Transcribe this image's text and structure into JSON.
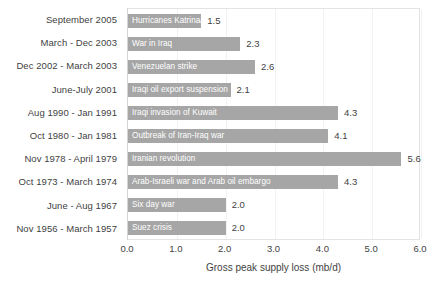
{
  "chart_data": {
    "type": "bar",
    "orientation": "horizontal",
    "title": "",
    "xlabel": "Gross peak supply loss (mb/d)",
    "ylabel": "",
    "xlim": [
      0.0,
      6.0
    ],
    "xticks": [
      "0.0",
      "1.0",
      "2.0",
      "3.0",
      "4.0",
      "5.0",
      "6.0"
    ],
    "xtick_values": [
      0.0,
      1.0,
      2.0,
      3.0,
      4.0,
      5.0,
      6.0
    ],
    "grid": true,
    "legend": "none",
    "bar_color": "#a6a6a6",
    "bar_label_color": "#ffffff",
    "value_label_color": "#3f3f3f",
    "categories": [
      "September 2005",
      "March - Dec 2003",
      "Dec 2002 - March 2003",
      "June-July 2001",
      "Aug 1990 - Jan 1991",
      "Oct 1980 - Jan 1981",
      "Nov 1978 - April 1979",
      "Oct 1973 - March 1974",
      "June - Aug 1967",
      "Nov 1956 - March 1957"
    ],
    "values": [
      1.5,
      2.3,
      2.6,
      2.1,
      4.3,
      4.1,
      5.6,
      4.3,
      2.0,
      2.0
    ],
    "value_labels": [
      "1.5",
      "2.3",
      "2.6",
      "2.1",
      "4.3",
      "4.1",
      "5.6",
      "4.3",
      "2.0",
      "2.0"
    ],
    "bar_labels": [
      "Hurricanes Katrina/Rita",
      "War in Iraq",
      "Venezuelan strike",
      "Iraqi oil export suspension",
      "Iraqi invasion of Kuwait",
      "Outbreak of Iran-Iraq war",
      "Iranian revolution",
      "Arab-Israeli war and Arab oil embargo",
      "Six day war",
      "Suez crisis"
    ],
    "bars": [
      {
        "category": "September 2005",
        "label": "Hurricanes Katrina/Rita",
        "value": 1.5,
        "value_label": "1.5"
      },
      {
        "category": "March - Dec 2003",
        "label": "War in Iraq",
        "value": 2.3,
        "value_label": "2.3"
      },
      {
        "category": "Dec 2002 - March 2003",
        "label": "Venezuelan strike",
        "value": 2.6,
        "value_label": "2.6"
      },
      {
        "category": "June-July 2001",
        "label": "Iraqi oil export suspension",
        "value": 2.1,
        "value_label": "2.1"
      },
      {
        "category": "Aug 1990 - Jan 1991",
        "label": "Iraqi invasion of Kuwait",
        "value": 4.3,
        "value_label": "4.3"
      },
      {
        "category": "Oct 1980 - Jan 1981",
        "label": "Outbreak of Iran-Iraq war",
        "value": 4.1,
        "value_label": "4.1"
      },
      {
        "category": "Nov 1978 - April 1979",
        "label": "Iranian revolution",
        "value": 5.6,
        "value_label": "5.6"
      },
      {
        "category": "Oct 1973 - March 1974",
        "label": "Arab-Israeli war and Arab oil embargo",
        "value": 4.3,
        "value_label": "4.3"
      },
      {
        "category": "June - Aug 1967",
        "label": "Six day war",
        "value": 2.0,
        "value_label": "2.0"
      },
      {
        "category": "Nov 1956 - March 1957",
        "label": "Suez crisis",
        "value": 2.0,
        "value_label": "2.0"
      }
    ]
  }
}
